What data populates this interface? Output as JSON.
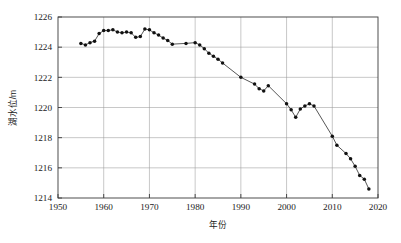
{
  "chart_data": {
    "type": "line",
    "title": "",
    "subtitle": "",
    "xlabel": "年份",
    "ylabel": "湖水位/m",
    "xlim": [
      1950,
      2020
    ],
    "ylim": [
      1214,
      1226
    ],
    "xticks": [
      1950,
      1960,
      1970,
      1980,
      1990,
      2000,
      2010,
      2020
    ],
    "yticks": [
      1214,
      1216,
      1218,
      1220,
      1222,
      1224,
      1226
    ],
    "xtick_labels": [
      "1950",
      "1960",
      "1970",
      "1980",
      "1990",
      "2000",
      "2010",
      "2020"
    ],
    "ytick_labels": [
      "1214",
      "1216",
      "1218",
      "1220",
      "1222",
      "1224",
      "1226"
    ],
    "grid": true,
    "grid_axis": "both",
    "legend": null,
    "legend_position": "none",
    "marker": "filled-circle",
    "line_color": "#2b2b2b",
    "marker_color": "#111111",
    "series": [
      {
        "name": "湖水位",
        "x": [
          1955,
          1956,
          1957,
          1958,
          1959,
          1960,
          1961,
          1962,
          1963,
          1964,
          1965,
          1966,
          1967,
          1968,
          1969,
          1970,
          1971,
          1972,
          1973,
          1974,
          1975,
          1978,
          1980,
          1981,
          1982,
          1983,
          1984,
          1985,
          1986,
          1990,
          1993,
          1994,
          1995,
          1996,
          2000,
          2001,
          2002,
          2003,
          2004,
          2005,
          2006,
          2010,
          2011,
          2013,
          2014,
          2015,
          2016,
          2017,
          2018
        ],
        "y": [
          1224.25,
          1224.15,
          1224.3,
          1224.4,
          1224.9,
          1225.1,
          1225.1,
          1225.15,
          1225.0,
          1224.95,
          1225.0,
          1224.95,
          1224.65,
          1224.7,
          1225.2,
          1225.15,
          1224.95,
          1224.8,
          1224.6,
          1224.45,
          1224.2,
          1224.25,
          1224.3,
          1224.15,
          1223.9,
          1223.6,
          1223.4,
          1223.2,
          1222.95,
          1222.0,
          1221.55,
          1221.25,
          1221.1,
          1221.45,
          1220.25,
          1219.85,
          1219.35,
          1219.9,
          1220.1,
          1220.25,
          1220.1,
          1218.1,
          1217.5,
          1216.95,
          1216.6,
          1216.1,
          1215.5,
          1215.25,
          1214.6
        ]
      }
    ]
  },
  "axis": {
    "x_label": "年份",
    "y_label": "湖水位/m"
  }
}
